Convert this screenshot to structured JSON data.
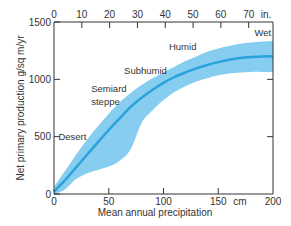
{
  "chart_data": {
    "type": "area",
    "title": "",
    "xlabel": "Mean annual precipitation",
    "x_unit_bottom": "cm",
    "x_unit_top": "in.",
    "ylabel": "Net primary production g/sq m/yr",
    "xlim": [
      0,
      200
    ],
    "ylim": [
      0,
      1500
    ],
    "x_ticks_bottom": [
      0,
      50,
      100,
      150,
      200
    ],
    "x_ticks_top": [
      0,
      10,
      20,
      30,
      40,
      50,
      60,
      70
    ],
    "y_ticks": [
      0,
      500,
      1000,
      1500
    ],
    "grid": false,
    "series": [
      {
        "name": "Mean",
        "x": [
          0,
          10,
          20,
          30,
          40,
          50,
          60,
          70,
          80,
          90,
          100,
          110,
          120,
          130,
          140,
          150,
          160,
          170,
          180,
          190,
          200
        ],
        "values": [
          20,
          120,
          230,
          340,
          450,
          560,
          660,
          760,
          840,
          910,
          970,
          1020,
          1060,
          1095,
          1125,
          1150,
          1170,
          1185,
          1195,
          1200,
          1200
        ]
      },
      {
        "name": "Upper bound",
        "x": [
          0,
          10,
          20,
          30,
          40,
          50,
          60,
          70,
          80,
          90,
          100,
          110,
          120,
          130,
          140,
          150,
          160,
          170,
          180,
          190,
          200
        ],
        "values": [
          60,
          200,
          340,
          470,
          590,
          700,
          800,
          880,
          950,
          1010,
          1060,
          1110,
          1160,
          1200,
          1240,
          1270,
          1290,
          1310,
          1320,
          1330,
          1335
        ]
      },
      {
        "name": "Lower bound",
        "x": [
          0,
          10,
          20,
          30,
          40,
          50,
          60,
          70,
          80,
          90,
          100,
          110,
          120,
          130,
          140,
          150,
          160,
          170,
          180,
          190,
          200
        ],
        "values": [
          0,
          40,
          130,
          180,
          210,
          240,
          290,
          390,
          620,
          730,
          820,
          890,
          940,
          980,
          1010,
          1035,
          1050,
          1060,
          1065,
          1065,
          1065
        ]
      }
    ],
    "annotations": [
      {
        "text": "Desert",
        "x": 4,
        "y": 470
      },
      {
        "text": "Semiard",
        "x": 34,
        "y": 890
      },
      {
        "text": "steppe",
        "x": 34,
        "y": 780
      },
      {
        "text": "Subhumid",
        "x": 64,
        "y": 1050
      },
      {
        "text": "Humid",
        "x": 105,
        "y": 1260
      },
      {
        "text": "Wet",
        "x": 183,
        "y": 1380
      }
    ],
    "colors": {
      "band": "#86cdf0",
      "line": "#2aa3dc",
      "axis": "#333333"
    }
  }
}
